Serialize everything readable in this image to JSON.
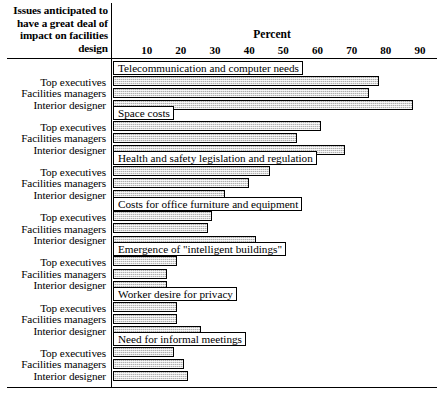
{
  "header": {
    "corner_title_lines": [
      "Issues anticipated to",
      "have a great deal of",
      "impact on facilities",
      "design"
    ],
    "axis_title": "Percent"
  },
  "chart_data": {
    "type": "bar",
    "orientation": "horizontal",
    "xlabel": "Percent",
    "ylabel": "",
    "xlim": [
      0,
      92
    ],
    "xticks": [
      10,
      20,
      30,
      40,
      50,
      60,
      70,
      80,
      90
    ],
    "grid": false,
    "legend": "none",
    "categories": [
      "Top executives",
      "Facilities managers",
      "Interior designer"
    ],
    "groups": [
      {
        "label": "Telecommunication and computer needs",
        "values": [
          78,
          75,
          88
        ]
      },
      {
        "label": "Space costs",
        "values": [
          61,
          54,
          68
        ]
      },
      {
        "label": "Health and safety legislation and regulation",
        "values": [
          46,
          40,
          33
        ]
      },
      {
        "label": "Costs for office furniture and equipment",
        "values": [
          29,
          28,
          42
        ]
      },
      {
        "label": "Emergence of \"intelligent buildings\"",
        "values": [
          19,
          16,
          16
        ]
      },
      {
        "label": "Worker desire for privacy",
        "values": [
          19,
          19,
          26
        ]
      },
      {
        "label": "Need for informal meetings",
        "values": [
          18,
          21,
          22
        ]
      }
    ]
  }
}
